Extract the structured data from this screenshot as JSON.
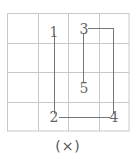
{
  "diagram": {
    "caption": "(×)",
    "grid": {
      "rows": 4,
      "cols": 4,
      "x_lines": [
        7,
        38,
        68,
        99,
        129
      ],
      "y_lines": [
        13,
        43,
        72,
        102,
        131
      ],
      "line_color": "#c8c8c8"
    },
    "stroke_order_path_color": "#777777",
    "points": [
      {
        "label": "1",
        "x": 54,
        "y": 32
      },
      {
        "label": "2",
        "x": 54,
        "y": 117
      },
      {
        "label": "3",
        "x": 84,
        "y": 29
      },
      {
        "label": "4",
        "x": 114,
        "y": 117
      },
      {
        "label": "5",
        "x": 84,
        "y": 88
      }
    ]
  }
}
